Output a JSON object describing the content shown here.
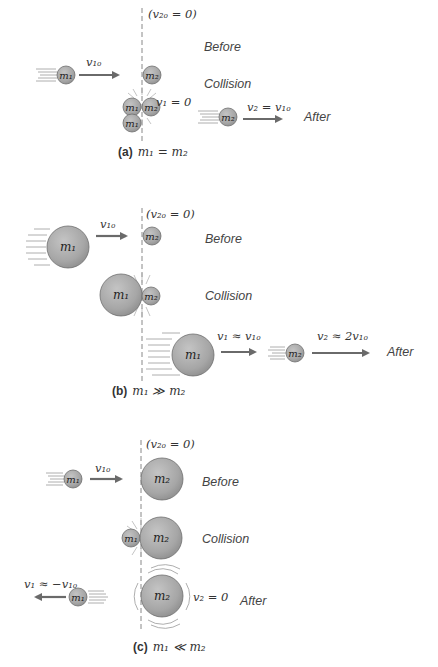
{
  "figure": {
    "colors": {
      "ball_fill": "#a9a9a9",
      "ball_edge": "#6e6e6e",
      "arrow": "#6a6a6a",
      "dashed_line": "#888888",
      "text": "#333333"
    },
    "state_labels": {
      "before": "Before",
      "collision": "Collision",
      "after": "After"
    },
    "panels": [
      {
        "id": "a",
        "caption_letter": "(a)",
        "caption_relation": "m₁ = m₂",
        "ball_labels": {
          "m1": "m₁",
          "m2": "m₂"
        },
        "labels": {
          "v1_initial": "v₁ₒ",
          "v2_initial": "(v₂ₒ = 0)",
          "v1_final": "v₁ = 0",
          "v2_final": "v₂ = v₁ₒ"
        }
      },
      {
        "id": "b",
        "caption_letter": "(b)",
        "caption_relation": "m₁ ≫ m₂",
        "ball_labels": {
          "m1": "m₁",
          "m2": "m₂"
        },
        "labels": {
          "v1_initial": "v₁ₒ",
          "v2_initial": "(v₂ₒ = 0)",
          "v1_final": "v₁ ≈ v₁ₒ",
          "v2_final": "v₂ ≈ 2v₁ₒ"
        }
      },
      {
        "id": "c",
        "caption_letter": "(c)",
        "caption_relation": "m₁ ≪ m₂",
        "ball_labels": {
          "m1": "m₁",
          "m2": "m₂"
        },
        "labels": {
          "v1_initial": "v₁ₒ",
          "v2_initial": "(v₂ₒ = 0)",
          "v1_final": "v₁ ≈ −v₁ₒ",
          "v2_final": "v₂ = 0"
        }
      }
    ]
  }
}
